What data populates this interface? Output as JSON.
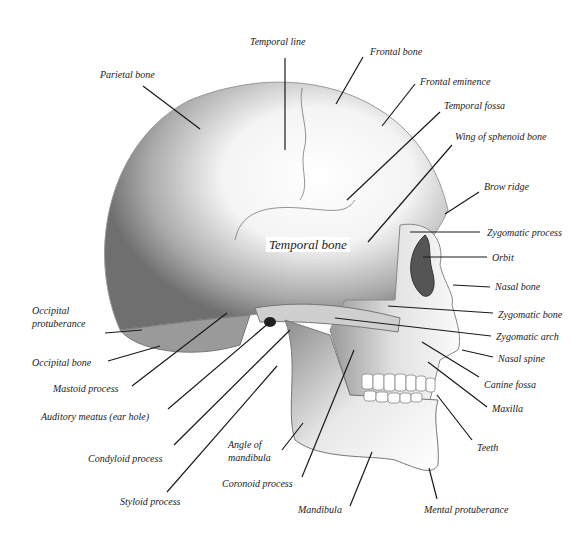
{
  "diagram": {
    "colors": {
      "background": "#ffffff",
      "line": "#1a1a1a",
      "shade": "#888888"
    },
    "labels": [
      {
        "id": "temporal-line",
        "text": "Temporal line",
        "x": 250,
        "y": 35
      },
      {
        "id": "parietal-bone",
        "text": "Parietal bone",
        "x": 100,
        "y": 68
      },
      {
        "id": "frontal-bone",
        "text": "Frontal bone",
        "x": 370,
        "y": 45
      },
      {
        "id": "frontal-eminence",
        "text": "Frontal eminence",
        "x": 420,
        "y": 75
      },
      {
        "id": "temporal-fossa",
        "text": "Temporal fossa",
        "x": 444,
        "y": 99
      },
      {
        "id": "wing-of-sphenoid",
        "text": "Wing of  sphenoid bone",
        "x": 455,
        "y": 130
      },
      {
        "id": "brow-ridge",
        "text": "Brow ridge",
        "x": 484,
        "y": 180
      },
      {
        "id": "temporal-bone",
        "text": "Temporal bone",
        "x": 266,
        "y": 237
      },
      {
        "id": "zygomatic-process",
        "text": "Zygomatic process",
        "x": 487,
        "y": 226
      },
      {
        "id": "orbit",
        "text": "Orbit",
        "x": 492,
        "y": 251
      },
      {
        "id": "nasal-bone",
        "text": "Nasal bone",
        "x": 495,
        "y": 280
      },
      {
        "id": "occipital-protuberance",
        "text": "Occipital\nprotuberance",
        "x": 32,
        "y": 304
      },
      {
        "id": "zygomatic-bone",
        "text": "Zygomatic bone",
        "x": 498,
        "y": 308
      },
      {
        "id": "zygomatic-arch",
        "text": "Zygomatic arch",
        "x": 496,
        "y": 330
      },
      {
        "id": "occipital-bone",
        "text": "Occipital bone",
        "x": 32,
        "y": 356
      },
      {
        "id": "nasal-spine",
        "text": "Nasal spine",
        "x": 498,
        "y": 352
      },
      {
        "id": "mastoid-process",
        "text": "Mastoid process",
        "x": 53,
        "y": 382
      },
      {
        "id": "canine-fossa",
        "text": "Canine fossa",
        "x": 484,
        "y": 378
      },
      {
        "id": "maxilla",
        "text": "Maxilla",
        "x": 492,
        "y": 402
      },
      {
        "id": "auditory-meatus",
        "text": "Auditory meatus (ear hole)",
        "x": 41,
        "y": 410
      },
      {
        "id": "angle-of-mandibula",
        "text": "Angle of\nmandibula",
        "x": 228,
        "y": 438
      },
      {
        "id": "teeth",
        "text": "Teeth",
        "x": 477,
        "y": 441
      },
      {
        "id": "condyloid-process",
        "text": "Condyloid process",
        "x": 88,
        "y": 452
      },
      {
        "id": "coronoid-process",
        "text": "Coronoid process",
        "x": 222,
        "y": 477
      },
      {
        "id": "styloid-process",
        "text": "Styloid process",
        "x": 120,
        "y": 495
      },
      {
        "id": "mandibula",
        "text": "Mandibula",
        "x": 298,
        "y": 503
      },
      {
        "id": "mental-protuberance",
        "text": "Mental protuberance",
        "x": 424,
        "y": 503
      }
    ],
    "leaders": [
      {
        "id": "temporal-line",
        "x1": 285,
        "y1": 58,
        "x2": 285,
        "y2": 150
      },
      {
        "id": "parietal-bone",
        "x1": 143,
        "y1": 86,
        "x2": 200,
        "y2": 129
      },
      {
        "id": "frontal-bone",
        "x1": 363,
        "y1": 57,
        "x2": 336,
        "y2": 104
      },
      {
        "id": "frontal-eminence",
        "x1": 415,
        "y1": 84,
        "x2": 382,
        "y2": 126
      },
      {
        "id": "temporal-fossa",
        "x1": 440,
        "y1": 112,
        "x2": 347,
        "y2": 200
      },
      {
        "id": "wing-of-sphenoid",
        "x1": 452,
        "y1": 145,
        "x2": 368,
        "y2": 242
      },
      {
        "id": "brow-ridge",
        "x1": 479,
        "y1": 192,
        "x2": 445,
        "y2": 214
      },
      {
        "id": "zygomatic-process",
        "x1": 410,
        "y1": 232,
        "x2": 480,
        "y2": 232
      },
      {
        "id": "orbit",
        "x1": 423,
        "y1": 257,
        "x2": 487,
        "y2": 257
      },
      {
        "id": "nasal-bone",
        "x1": 453,
        "y1": 285,
        "x2": 490,
        "y2": 287
      },
      {
        "id": "zygomatic-bone",
        "x1": 388,
        "y1": 306,
        "x2": 493,
        "y2": 313
      },
      {
        "id": "zygomatic-arch",
        "x1": 335,
        "y1": 318,
        "x2": 491,
        "y2": 336
      },
      {
        "id": "nasal-spine",
        "x1": 462,
        "y1": 350,
        "x2": 493,
        "y2": 357
      },
      {
        "id": "canine-fossa",
        "x1": 422,
        "y1": 342,
        "x2": 479,
        "y2": 377
      },
      {
        "id": "maxilla",
        "x1": 428,
        "y1": 362,
        "x2": 487,
        "y2": 407
      },
      {
        "id": "teeth",
        "x1": 437,
        "y1": 395,
        "x2": 472,
        "y2": 440
      },
      {
        "id": "mental-protuberance",
        "x1": 429,
        "y1": 468,
        "x2": 437,
        "y2": 499
      },
      {
        "id": "occipital-protuberance",
        "x1": 105,
        "y1": 333,
        "x2": 142,
        "y2": 330
      },
      {
        "id": "occipital-bone",
        "x1": 108,
        "y1": 361,
        "x2": 160,
        "y2": 346
      },
      {
        "id": "mastoid-process",
        "x1": 132,
        "y1": 386,
        "x2": 227,
        "y2": 313
      },
      {
        "id": "auditory-meatus",
        "x1": 168,
        "y1": 409,
        "x2": 270,
        "y2": 322
      },
      {
        "id": "condyloid-process",
        "x1": 174,
        "y1": 445,
        "x2": 290,
        "y2": 330
      },
      {
        "id": "styloid-process",
        "x1": 167,
        "y1": 492,
        "x2": 277,
        "y2": 366
      },
      {
        "id": "angle-of-mandibula",
        "x1": 282,
        "y1": 450,
        "x2": 303,
        "y2": 423
      },
      {
        "id": "coronoid-process",
        "x1": 302,
        "y1": 477,
        "x2": 354,
        "y2": 350
      },
      {
        "id": "mandibula",
        "x1": 350,
        "y1": 506,
        "x2": 372,
        "y2": 452
      }
    ]
  }
}
